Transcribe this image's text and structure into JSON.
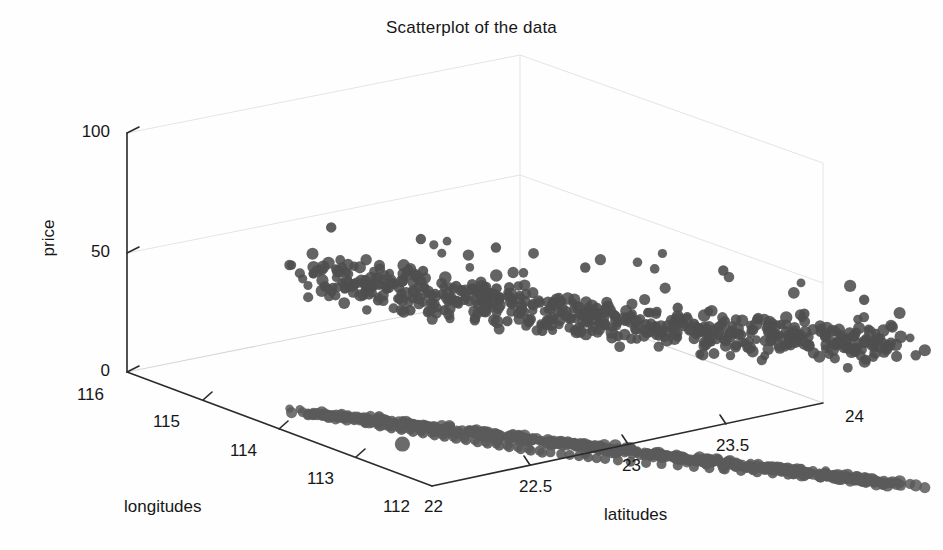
{
  "figure": {
    "title": "Scatterplot of the data",
    "background_color": "#fefefe",
    "marker_color": "#555555",
    "axis_color": "#2b2b2b",
    "grid_color": "#e2e2e2",
    "width": 943,
    "height": 550
  },
  "axes": {
    "z": {
      "label": "price",
      "ticks": [
        "0",
        "50",
        "100"
      ],
      "values": [
        0,
        50,
        100
      ],
      "range": [
        0,
        100
      ]
    },
    "x": {
      "label": "longitudes",
      "ticks": [
        "116",
        "115",
        "114",
        "113",
        "112"
      ],
      "values": [
        116,
        115,
        114,
        113,
        112
      ],
      "range": [
        116,
        112
      ]
    },
    "y": {
      "label": "latitudes",
      "ticks": [
        "22",
        "22.5",
        "23",
        "23.5",
        "24"
      ],
      "values": [
        22,
        22.5,
        23,
        23.5,
        24
      ],
      "range": [
        22,
        24
      ]
    }
  },
  "chart_data": {
    "type": "scatter",
    "title": "Scatterplot of the data",
    "xlabel": "longitudes",
    "ylabel": "latitudes",
    "zlabel": "price",
    "projection": "3d",
    "xlim": [
      116,
      112
    ],
    "ylim": [
      22,
      24
    ],
    "zlim": [
      0,
      100
    ],
    "grid": true,
    "legend": null,
    "series": [
      {
        "name": "price points",
        "marker": "filled-circle",
        "color": "#555555",
        "note": "dense elongated cloud of price values concentrated between roughly 45 and 75, spread along latitude 22.3-23.6 and longitude 113.0-114.6, with scattered high outliers near 78-85"
      },
      {
        "name": "ground projection",
        "marker": "filled-circle",
        "color": "#5a5a5a",
        "note": "same longitude/latitude locations drawn at price = 0 on the floor plane, forming a clumped west-east band plus one isolated south-western point"
      }
    ],
    "points": [
      {
        "lon": 114.55,
        "lat": 22.3,
        "price": 63
      },
      {
        "lon": 114.48,
        "lat": 22.32,
        "price": 57
      },
      {
        "lon": 114.42,
        "lat": 22.34,
        "price": 55
      },
      {
        "lon": 114.38,
        "lat": 22.33,
        "price": 60
      },
      {
        "lon": 114.35,
        "lat": 22.36,
        "price": 52
      },
      {
        "lon": 114.3,
        "lat": 22.38,
        "price": 58
      },
      {
        "lon": 114.28,
        "lat": 22.35,
        "price": 66
      },
      {
        "lon": 114.25,
        "lat": 22.4,
        "price": 54
      },
      {
        "lon": 114.22,
        "lat": 22.37,
        "price": 61
      },
      {
        "lon": 114.2,
        "lat": 22.42,
        "price": 50
      },
      {
        "lon": 114.18,
        "lat": 22.39,
        "price": 57
      },
      {
        "lon": 114.15,
        "lat": 22.44,
        "price": 63
      },
      {
        "lon": 114.12,
        "lat": 22.41,
        "price": 56
      },
      {
        "lon": 114.1,
        "lat": 22.46,
        "price": 52
      },
      {
        "lon": 114.08,
        "lat": 22.43,
        "price": 68
      },
      {
        "lon": 114.05,
        "lat": 22.48,
        "price": 59
      },
      {
        "lon": 114.02,
        "lat": 22.45,
        "price": 55
      },
      {
        "lon": 114.0,
        "lat": 22.5,
        "price": 62
      },
      {
        "lon": 113.98,
        "lat": 22.47,
        "price": 53
      },
      {
        "lon": 113.95,
        "lat": 22.52,
        "price": 58
      },
      {
        "lon": 113.92,
        "lat": 22.49,
        "price": 64
      },
      {
        "lon": 113.9,
        "lat": 22.54,
        "price": 51
      },
      {
        "lon": 113.88,
        "lat": 22.51,
        "price": 60
      },
      {
        "lon": 113.85,
        "lat": 22.56,
        "price": 57
      },
      {
        "lon": 113.82,
        "lat": 22.53,
        "price": 54
      },
      {
        "lon": 113.8,
        "lat": 22.58,
        "price": 65
      },
      {
        "lon": 113.78,
        "lat": 22.55,
        "price": 59
      },
      {
        "lon": 113.75,
        "lat": 22.6,
        "price": 52
      },
      {
        "lon": 113.72,
        "lat": 22.57,
        "price": 61
      },
      {
        "lon": 113.7,
        "lat": 22.62,
        "price": 56
      },
      {
        "lon": 113.68,
        "lat": 22.59,
        "price": 67
      },
      {
        "lon": 113.65,
        "lat": 22.64,
        "price": 53
      },
      {
        "lon": 113.62,
        "lat": 22.61,
        "price": 58
      },
      {
        "lon": 113.6,
        "lat": 22.66,
        "price": 62
      },
      {
        "lon": 113.58,
        "lat": 22.63,
        "price": 55
      },
      {
        "lon": 113.55,
        "lat": 22.68,
        "price": 60
      },
      {
        "lon": 113.52,
        "lat": 22.65,
        "price": 51
      },
      {
        "lon": 113.5,
        "lat": 22.7,
        "price": 64
      },
      {
        "lon": 113.48,
        "lat": 22.72,
        "price": 57
      },
      {
        "lon": 113.45,
        "lat": 22.74,
        "price": 54
      },
      {
        "lon": 113.42,
        "lat": 22.76,
        "price": 59
      },
      {
        "lon": 113.4,
        "lat": 22.78,
        "price": 63
      },
      {
        "lon": 113.38,
        "lat": 22.8,
        "price": 56
      },
      {
        "lon": 113.35,
        "lat": 22.83,
        "price": 52
      },
      {
        "lon": 113.32,
        "lat": 22.86,
        "price": 61
      },
      {
        "lon": 113.3,
        "lat": 22.9,
        "price": 58
      },
      {
        "lon": 113.28,
        "lat": 22.94,
        "price": 55
      },
      {
        "lon": 113.25,
        "lat": 22.98,
        "price": 66
      },
      {
        "lon": 113.22,
        "lat": 23.02,
        "price": 60
      },
      {
        "lon": 113.2,
        "lat": 23.06,
        "price": 53
      },
      {
        "lon": 113.18,
        "lat": 23.1,
        "price": 62
      },
      {
        "lon": 113.15,
        "lat": 23.14,
        "price": 57
      },
      {
        "lon": 113.12,
        "lat": 23.18,
        "price": 64
      },
      {
        "lon": 113.1,
        "lat": 23.22,
        "price": 59
      },
      {
        "lon": 113.08,
        "lat": 23.26,
        "price": 55
      },
      {
        "lon": 113.05,
        "lat": 23.3,
        "price": 68
      },
      {
        "lon": 113.02,
        "lat": 23.34,
        "price": 61
      },
      {
        "lon": 113.0,
        "lat": 23.38,
        "price": 56
      },
      {
        "lon": 114.6,
        "lat": 22.28,
        "price": 79
      },
      {
        "lon": 114.2,
        "lat": 22.45,
        "price": 80
      },
      {
        "lon": 113.9,
        "lat": 22.6,
        "price": 81
      },
      {
        "lon": 113.55,
        "lat": 22.78,
        "price": 78
      },
      {
        "lon": 113.2,
        "lat": 23.1,
        "price": 83
      },
      {
        "lon": 112.95,
        "lat": 23.45,
        "price": 76
      }
    ]
  }
}
